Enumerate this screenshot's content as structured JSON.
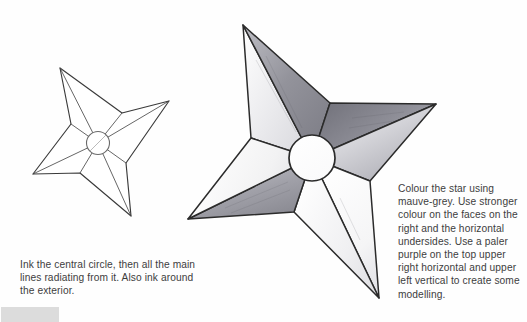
{
  "page": {
    "background_color": "#fefefe",
    "ink_color": "#2b2b2b"
  },
  "captions": {
    "left": {
      "name": "ink-instruction-caption",
      "text": "Ink the central circle, then all the main lines radiating from it. Also ink around the exterior."
    },
    "right": {
      "name": "colour-instruction-caption",
      "text": "Colour the star using mauve-grey. Use stronger colour on the faces on the right and the horizontal undersides. Use a paler purple on the top upper right horizontal and upper left vertical to create some modelling."
    }
  },
  "figures": {
    "small_star": {
      "label": "line-art ninja star",
      "stroke": "#3a3a3a",
      "fill": "#ffffff",
      "center": {
        "x": 98,
        "y": 143,
        "r": 11
      },
      "tips": [
        {
          "name": "top-left-point",
          "x": 60,
          "y": 68
        },
        {
          "name": "right-point",
          "x": 169,
          "y": 101
        },
        {
          "name": "bottom-point",
          "x": 131,
          "y": 216
        },
        {
          "name": "left-point",
          "x": 33,
          "y": 174
        }
      ],
      "inner": [
        {
          "name": "inner-top-right",
          "x": 122,
          "y": 113
        },
        {
          "name": "inner-bottom-right",
          "x": 126,
          "y": 163
        },
        {
          "name": "inner-bottom-left",
          "x": 80,
          "y": 173
        },
        {
          "name": "inner-top-left",
          "x": 71,
          "y": 124
        }
      ]
    },
    "large_star": {
      "label": "shaded ninja star",
      "stroke": "#2b2b2b",
      "center": {
        "x": 312,
        "y": 158,
        "r": 23
      },
      "tips": [
        {
          "name": "top-left-point",
          "x": 243,
          "y": 25
        },
        {
          "name": "right-point",
          "x": 436,
          "y": 104
        },
        {
          "name": "bottom-point",
          "x": 379,
          "y": 298
        },
        {
          "name": "left-point",
          "x": 188,
          "y": 219
        }
      ],
      "inner": [
        {
          "name": "inner-top-right",
          "x": 330,
          "y": 103
        },
        {
          "name": "inner-bottom-right",
          "x": 370,
          "y": 181
        },
        {
          "name": "inner-bottom-left",
          "x": 294,
          "y": 212
        },
        {
          "name": "inner-top-left",
          "x": 251,
          "y": 138
        }
      ],
      "shading": {
        "strong": "#6e6e74",
        "mid": "#9a9aa0",
        "pale": "#c9c9cf",
        "highlight": "#f2f2f4"
      }
    }
  },
  "corner": {
    "name": "page-corner-swatch",
    "color": "#dcdcdc"
  }
}
